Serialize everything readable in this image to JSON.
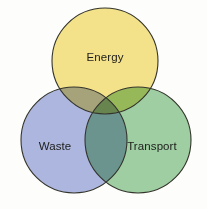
{
  "diagram": {
    "type": "venn",
    "set_count": 3,
    "background_color": "#fdfdfb",
    "outline_color": "#34342c",
    "sets": [
      {
        "id": "energy",
        "label": "Energy",
        "color": "#f5e48c",
        "center_x": 105,
        "center_y": 61,
        "radius": 53,
        "label_x": 105,
        "label_y": 57
      },
      {
        "id": "waste",
        "label": "Waste",
        "color": "#aeb8e2",
        "center_x": 74,
        "center_y": 140,
        "radius": 53,
        "label_x": 55,
        "label_y": 146
      },
      {
        "id": "transport",
        "label": "Transport",
        "color": "#9fd0a4",
        "center_x": 138,
        "center_y": 140,
        "radius": 53,
        "label_x": 152,
        "label_y": 146
      }
    ],
    "intersection_colors": {
      "energy_waste": "#a8ab97",
      "energy_transport": "#a8d982",
      "waste_transport": "#7faebe",
      "energy_waste_transport": "#7fafa8"
    }
  }
}
